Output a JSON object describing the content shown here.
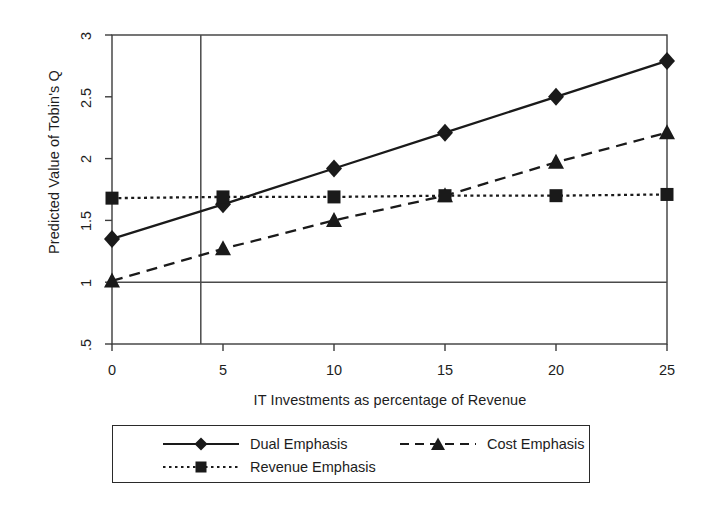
{
  "chart_data": {
    "type": "line",
    "title": "",
    "subtitle": "",
    "xlabel": "IT Investments as percentage of Revenue",
    "ylabel": "Predicted Value of Tobin's Q",
    "x": [
      0,
      5,
      10,
      15,
      20,
      25
    ],
    "xticks": [
      "0",
      "5",
      "10",
      "15",
      "20",
      "25"
    ],
    "yticks": [
      ".5",
      "1",
      "1.5",
      "2",
      "2.5",
      "3"
    ],
    "ytick_values": [
      0.5,
      1,
      1.5,
      2,
      2.5,
      3
    ],
    "xlim": [
      0,
      25
    ],
    "ylim": [
      0.5,
      3
    ],
    "grid": false,
    "legend_position": "below-plot",
    "series": [
      {
        "name": "Dual Emphasis",
        "marker": "diamond",
        "linestyle": "solid",
        "color": "#1a1a1a",
        "values": [
          1.35,
          1.63,
          1.92,
          2.21,
          2.5,
          2.79
        ]
      },
      {
        "name": "Cost Emphasis",
        "marker": "triangle",
        "linestyle": "dashed",
        "color": "#1a1a1a",
        "values": [
          1.01,
          1.27,
          1.5,
          1.7,
          1.97,
          2.21
        ]
      },
      {
        "name": "Revenue Emphasis",
        "marker": "square",
        "linestyle": "dotted",
        "color": "#1a1a1a",
        "values": [
          1.68,
          1.69,
          1.69,
          1.7,
          1.7,
          1.71
        ]
      }
    ],
    "reference_lines": [
      {
        "orientation": "vertical",
        "value": 4,
        "style": "solid",
        "color": "#4a4a4a"
      },
      {
        "orientation": "horizontal",
        "value": 1,
        "style": "solid",
        "color": "#4a4a4a"
      }
    ]
  },
  "legend": {
    "entries": [
      {
        "label": "Dual Emphasis",
        "marker": "diamond",
        "linestyle": "solid"
      },
      {
        "label": "Cost Emphasis",
        "marker": "triangle",
        "linestyle": "dashed"
      },
      {
        "label": "Revenue Emphasis",
        "marker": "square",
        "linestyle": "dotted"
      }
    ]
  },
  "colors": {
    "ink": "#1a1a1a",
    "axis": "#3c3c3c",
    "reference": "#4a4a4a",
    "background": "#ffffff"
  }
}
